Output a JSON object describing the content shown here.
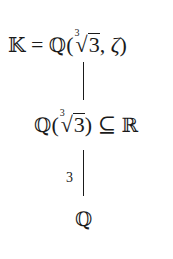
{
  "diagram": {
    "type": "field-extension-tower",
    "nodes": {
      "top": {
        "lhs": "𝕂",
        "eq": "=",
        "field": "ℚ",
        "open": "(",
        "root_index": "3",
        "radical": "√",
        "radicand": "3",
        "comma": ",",
        "generator2": "ζ",
        "close": ")"
      },
      "middle": {
        "field": "ℚ",
        "open": "(",
        "root_index": "3",
        "radical": "√",
        "radicand": "3",
        "close": ")",
        "relation": "⊆",
        "superfield": "ℝ"
      },
      "bottom": {
        "field": "ℚ"
      }
    },
    "edges": [
      {
        "from": "middle",
        "to": "top",
        "label": ""
      },
      {
        "from": "bottom",
        "to": "middle",
        "label": "3"
      }
    ]
  }
}
